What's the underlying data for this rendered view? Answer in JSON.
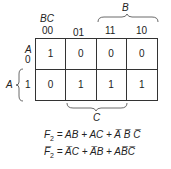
{
  "kmap": {
    "corner_label": "BC",
    "col_headers": [
      "00",
      "01",
      "11",
      "10"
    ],
    "row_var": "A",
    "row_headers": [
      "0",
      "1"
    ],
    "cells": [
      [
        "1",
        "0",
        "0",
        "0"
      ],
      [
        "0",
        "1",
        "1",
        "1"
      ]
    ],
    "brace_top_label": "B",
    "brace_bottom_label": "C",
    "brace_left_label": "A"
  },
  "equations": [
    {
      "lhs": "F",
      "sub": "2",
      "rhs": "= AB + AC + A̅ B̅ C̅"
    },
    {
      "lhs": "F̅",
      "sub": "2",
      "rhs": "= A̅C + A̅B + AB̅C̅"
    }
  ]
}
